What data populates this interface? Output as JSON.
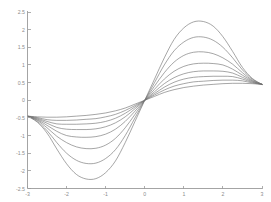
{
  "figure": {
    "title": "",
    "background_color": "#ffffff",
    "axis_color": "#9a9a9a",
    "curve_color": "#6f6f6f",
    "tick_label_color": "#8c8c8c"
  },
  "chart_data": {
    "type": "line",
    "title": "",
    "subtitle": "",
    "xlabel": "",
    "ylabel": "",
    "xlim": [
      -3,
      3
    ],
    "ylim": [
      -2.5,
      2.5
    ],
    "grid": false,
    "legend": null,
    "legend_position": "none",
    "annotations": [],
    "xticks": [
      -3,
      -2,
      -1,
      0,
      1,
      2,
      3
    ],
    "xticklabels": [
      "-3",
      "-2",
      "-1",
      "0",
      "1",
      "2",
      "3"
    ],
    "yticks": [
      -2.5,
      -2,
      -1.5,
      -1,
      -0.5,
      0,
      0.5,
      1,
      1.5,
      2,
      2.5
    ],
    "yticklabels": [
      "-2.5",
      "-2",
      "-1.5",
      "-1",
      "-0.5",
      "0",
      "0.5",
      "1",
      "1.5",
      "2",
      "2.5"
    ],
    "x": [
      -3,
      -2.75,
      -2.5,
      -2.25,
      -2,
      -1.75,
      -1.5,
      -1.25,
      -1,
      -0.75,
      -0.5,
      -0.25,
      0,
      0.25,
      0.5,
      0.75,
      1,
      1.25,
      1.5,
      1.75,
      2,
      2.25,
      2.5,
      2.75,
      3
    ],
    "series": [
      {
        "name": "curve-1",
        "peak": 2.25,
        "trough": -2.25,
        "values": [
          -0.45,
          -0.62,
          -0.93,
          -1.38,
          -1.8,
          -2.1,
          -2.23,
          -2.22,
          -2.05,
          -1.72,
          -1.2,
          -0.6,
          0,
          0.6,
          1.2,
          1.72,
          2.05,
          2.22,
          2.23,
          2.1,
          1.8,
          1.38,
          0.93,
          0.62,
          0.45
        ]
      },
      {
        "name": "curve-2",
        "peak": 1.8,
        "trough": -1.8,
        "values": [
          -0.45,
          -0.6,
          -0.86,
          -1.2,
          -1.5,
          -1.7,
          -1.79,
          -1.78,
          -1.65,
          -1.4,
          -1.0,
          -0.5,
          0,
          0.5,
          1.0,
          1.4,
          1.65,
          1.78,
          1.79,
          1.7,
          1.5,
          1.2,
          0.86,
          0.6,
          0.45
        ]
      },
      {
        "name": "curve-3",
        "peak": 1.38,
        "trough": -1.38,
        "values": [
          -0.45,
          -0.57,
          -0.78,
          -1.02,
          -1.2,
          -1.32,
          -1.37,
          -1.36,
          -1.27,
          -1.08,
          -0.78,
          -0.4,
          0,
          0.4,
          0.78,
          1.08,
          1.27,
          1.36,
          1.37,
          1.32,
          1.2,
          1.02,
          0.78,
          0.57,
          0.45
        ]
      },
      {
        "name": "curve-4",
        "peak": 1.05,
        "trough": -1.05,
        "values": [
          -0.45,
          -0.55,
          -0.71,
          -0.88,
          -1.0,
          -1.04,
          -1.05,
          -1.03,
          -0.96,
          -0.82,
          -0.6,
          -0.31,
          0,
          0.31,
          0.6,
          0.82,
          0.96,
          1.03,
          1.05,
          1.04,
          1.0,
          0.88,
          0.71,
          0.55,
          0.45
        ]
      },
      {
        "name": "curve-5",
        "peak": 0.83,
        "trough": -0.83,
        "values": [
          -0.45,
          -0.53,
          -0.65,
          -0.77,
          -0.82,
          -0.83,
          -0.83,
          -0.81,
          -0.75,
          -0.64,
          -0.47,
          -0.24,
          0,
          0.24,
          0.47,
          0.64,
          0.75,
          0.81,
          0.83,
          0.83,
          0.82,
          0.77,
          0.65,
          0.53,
          0.45
        ]
      },
      {
        "name": "curve-6",
        "peak": 0.68,
        "trough": -0.68,
        "values": [
          -0.45,
          -0.51,
          -0.6,
          -0.67,
          -0.68,
          -0.68,
          -0.67,
          -0.65,
          -0.6,
          -0.51,
          -0.37,
          -0.19,
          0,
          0.19,
          0.37,
          0.51,
          0.6,
          0.65,
          0.67,
          0.68,
          0.68,
          0.67,
          0.6,
          0.51,
          0.45
        ]
      },
      {
        "name": "curve-7",
        "peak": 0.57,
        "trough": -0.57,
        "values": [
          -0.45,
          -0.49,
          -0.55,
          -0.57,
          -0.57,
          -0.56,
          -0.54,
          -0.52,
          -0.47,
          -0.4,
          -0.29,
          -0.15,
          0,
          0.15,
          0.29,
          0.4,
          0.47,
          0.52,
          0.54,
          0.56,
          0.57,
          0.57,
          0.55,
          0.49,
          0.45
        ]
      },
      {
        "name": "curve-8",
        "peak": 0.48,
        "trough": -0.48,
        "values": [
          -0.45,
          -0.47,
          -0.48,
          -0.48,
          -0.47,
          -0.45,
          -0.43,
          -0.4,
          -0.36,
          -0.3,
          -0.22,
          -0.11,
          0,
          0.11,
          0.22,
          0.3,
          0.36,
          0.4,
          0.43,
          0.45,
          0.47,
          0.48,
          0.48,
          0.47,
          0.45
        ]
      }
    ]
  }
}
